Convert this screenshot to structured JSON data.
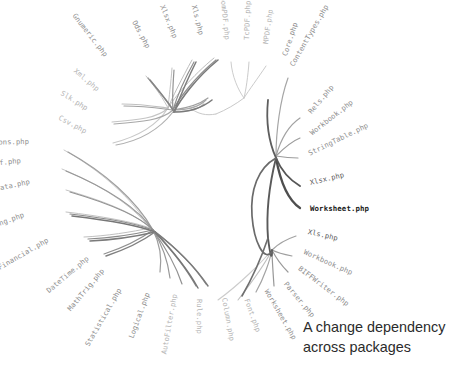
{
  "figure": {
    "type": "hierarchical-edge-bundling",
    "title_visible": false,
    "background_color": "#ffffff",
    "caption": {
      "line1": "A change dependency",
      "line2": "across packages",
      "color": "#2b2b2b"
    },
    "focus_node": "Worksheet.php",
    "colors": {
      "label_default": "#9a9a9a",
      "label_dim": "#b4b4b4",
      "label_mid": "#8d8d8d",
      "label_dark": "#5d5d5d",
      "label_focus": "#1a1a1a",
      "edge_light": "#cfcfcf",
      "edge_mid": "#9e9e9e",
      "edge_dark": "#5a5a5a"
    }
  },
  "chart_data": {
    "type": "diagram",
    "layout": "radial",
    "center": {
      "x": 233,
      "y": 196
    },
    "nodes": [
      {
        "label": "Csv.php",
        "x": 86,
        "y": 132,
        "angle": -152,
        "tone": "dim"
      },
      {
        "label": "Slk.php",
        "x": 87,
        "y": 109,
        "angle": -148,
        "tone": "dim"
      },
      {
        "label": "Xml.php",
        "x": 98,
        "y": 90,
        "angle": -140,
        "tone": "dim"
      },
      {
        "label": "Gnumeric.php",
        "x": 106,
        "y": 56,
        "angle": -128,
        "tone": "mid"
      },
      {
        "label": "Ods.php",
        "x": 148,
        "y": 48,
        "angle": -118,
        "tone": "mid"
      },
      {
        "label": "Xlsx.php",
        "x": 175,
        "y": 38,
        "angle": -112,
        "tone": "mid"
      },
      {
        "label": "Xls.php",
        "x": 201,
        "y": 35,
        "angle": -104,
        "tone": "mid"
      },
      {
        "label": "DomPDF.php",
        "x": 227,
        "y": 40,
        "angle": -96,
        "tone": "dim"
      },
      {
        "label": "TcPDF.php",
        "x": 247,
        "y": 40,
        "angle": -88,
        "tone": "dim"
      },
      {
        "label": "MPDF.php",
        "x": 266,
        "y": 44,
        "angle": -82,
        "tone": "dim"
      },
      {
        "label": "Core.php",
        "x": 285,
        "y": 56,
        "angle": -72,
        "tone": "mid"
      },
      {
        "label": "ContentTypes.php",
        "x": 292,
        "y": 66,
        "angle": -60,
        "tone": "mid"
      },
      {
        "label": "Rels.php",
        "x": 310,
        "y": 113,
        "angle": -50,
        "tone": "mid"
      },
      {
        "label": "Workbook.php",
        "x": 311,
        "y": 134,
        "angle": -38,
        "tone": "mid"
      },
      {
        "label": "StringTable.php",
        "x": 309,
        "y": 154,
        "angle": -26,
        "tone": "mid"
      },
      {
        "label": "Xlsx.php",
        "x": 310,
        "y": 183,
        "angle": -13,
        "tone": "dark"
      },
      {
        "label": "Worksheet.php",
        "x": 310,
        "y": 209,
        "angle": 0,
        "tone": "focus"
      },
      {
        "label": "Xls.php",
        "x": 308,
        "y": 232,
        "angle": 13,
        "tone": "dark"
      },
      {
        "label": "Workbook.php",
        "x": 304,
        "y": 252,
        "angle": 24,
        "tone": "mid"
      },
      {
        "label": "BIFFWriter.php",
        "x": 299,
        "y": 268,
        "angle": 37,
        "tone": "mid"
      },
      {
        "label": "Parser.php",
        "x": 285,
        "y": 283,
        "angle": 50,
        "tone": "mid"
      },
      {
        "label": "Worksheet.php",
        "x": 266,
        "y": 290,
        "angle": 60,
        "tone": "mid"
      },
      {
        "label": "Font.php",
        "x": 246,
        "y": 299,
        "angle": 70,
        "tone": "dim"
      },
      {
        "label": "Column.php",
        "x": 224,
        "y": 298,
        "angle": 80,
        "tone": "dim"
      },
      {
        "label": "Rule.php",
        "x": 199,
        "y": 299,
        "angle": 90,
        "tone": "dim"
      },
      {
        "label": "AutoFilter.php",
        "x": 175,
        "y": 294,
        "angle": 100,
        "tone": "dim"
      },
      {
        "label": "Logical.php",
        "x": 148,
        "y": 293,
        "angle": 110,
        "tone": "mid"
      },
      {
        "label": "Statistical.php",
        "x": 120,
        "y": 289,
        "angle": 120,
        "tone": "mid"
      },
      {
        "label": "MathTrig.php",
        "x": 103,
        "y": 270,
        "angle": 130,
        "tone": "mid"
      },
      {
        "label": "DateTime.php",
        "x": 88,
        "y": 258,
        "angle": 140,
        "tone": "mid"
      },
      {
        "label": "Financial.php",
        "x": 48,
        "y": 240,
        "angle": 150,
        "tone": "mid"
      },
      {
        "label": "Engineering.php",
        "x": 24,
        "y": 215,
        "angle": 160,
        "tone": "mid"
      },
      {
        "label": "TextData.php",
        "x": 30,
        "y": 182,
        "angle": 168,
        "tone": "mid"
      },
      {
        "label": "LookupRef.php",
        "x": 21,
        "y": 161,
        "angle": 174,
        "tone": "mid"
      },
      {
        "label": "Functions.php",
        "x": 29,
        "y": 142,
        "angle": 179,
        "tone": "mid"
      }
    ],
    "bundle_hubs": [
      {
        "name": "reader-writer-hub",
        "x": 168,
        "y": 108
      },
      {
        "name": "pdf-hub",
        "x": 243,
        "y": 97
      },
      {
        "name": "xlsx-hub",
        "x": 276,
        "y": 156
      },
      {
        "name": "xls-hub",
        "x": 272,
        "y": 250
      },
      {
        "name": "calc-hub",
        "x": 150,
        "y": 228
      }
    ]
  }
}
